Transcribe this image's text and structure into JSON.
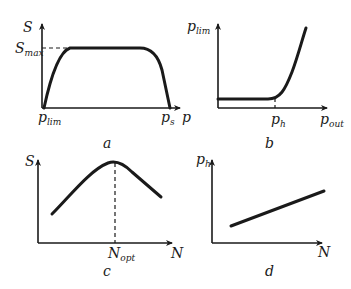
{
  "figure": {
    "panels": [
      {
        "id": "a",
        "caption": "a",
        "y_axis": {
          "label": "S",
          "sub": ""
        },
        "x_axis": {
          "label": "p",
          "sub": ""
        },
        "marks": {
          "ymax": {
            "label": "S",
            "sub": "max"
          },
          "x1": {
            "label": "p",
            "sub": "lim"
          },
          "x2": {
            "label": "p",
            "sub": "s"
          }
        },
        "curve": "plateau"
      },
      {
        "id": "b",
        "caption": "b",
        "y_axis": {
          "label": "p",
          "sub": "lim"
        },
        "x_axis": {
          "label": "p",
          "sub": "out"
        },
        "marks": {
          "x1": {
            "label": "p",
            "sub": "h"
          }
        },
        "curve": "flat-then-rising"
      },
      {
        "id": "c",
        "caption": "c",
        "y_axis": {
          "label": "S",
          "sub": ""
        },
        "x_axis": {
          "label": "N",
          "sub": ""
        },
        "marks": {
          "x1": {
            "label": "N",
            "sub": "opt"
          }
        },
        "curve": "peak"
      },
      {
        "id": "d",
        "caption": "d",
        "y_axis": {
          "label": "p",
          "sub": "h"
        },
        "x_axis": {
          "label": "N",
          "sub": ""
        },
        "curve": "linear-increasing"
      }
    ]
  }
}
